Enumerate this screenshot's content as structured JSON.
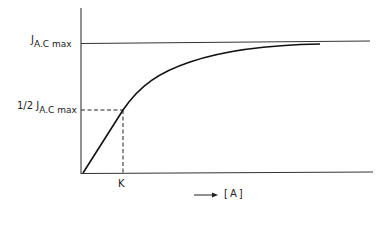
{
  "diagram": {
    "type": "saturation-curve",
    "y_labels": {
      "max": {
        "prefix": "J",
        "sub": "A.C max"
      },
      "half": {
        "prefix": "1/2 J",
        "sub": "A.C max"
      }
    },
    "x_labels": {
      "k": "K",
      "axis": "[A]",
      "arrow": "⟶"
    },
    "colors": {
      "line": "#222222",
      "background": "#ffffff"
    }
  }
}
